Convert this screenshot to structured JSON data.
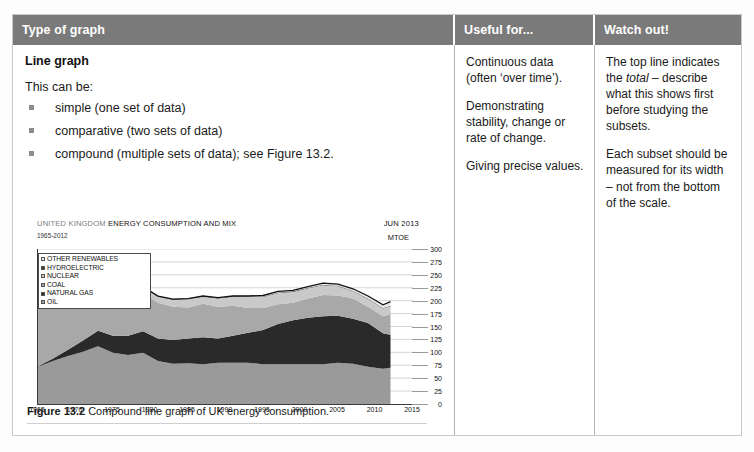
{
  "table": {
    "headers": [
      "Type of graph",
      "Useful for...",
      "Watch out!"
    ],
    "col1": {
      "title": "Line graph",
      "lead": "This can be:",
      "bullets": [
        "simple (one set of data)",
        "comparative (two sets of data)",
        "compound (multiple sets of data); see Figure 13.2."
      ],
      "caption_label": "Figure 13.2",
      "caption_text": " Compound line graph of UK energy consumption."
    },
    "col2": {
      "paragraphs": [
        "Continuous data (often ‘over time’).",
        "Demonstrating stability, change or rate of change.",
        "Giving precise values."
      ]
    },
    "col3": {
      "p1_a": "The top line indicates the ",
      "p1_em": "total",
      "p1_b": " – describe what this shows first before studying the subsets.",
      "p2": "Each subset should be measured for its width – not from the bottom of the scale."
    }
  },
  "chart_data": {
    "type": "area",
    "title_light": "UNITED KINGDOM ",
    "title_bold": "ENERGY CONSUMPTION AND MIX",
    "subtitle": "1965-2012",
    "date_label": "JUN 2013",
    "unit_label": "MTOE",
    "xlabel": "",
    "ylabel": "MTOE",
    "ylim": [
      0,
      300
    ],
    "yticks": [
      300,
      275,
      250,
      225,
      200,
      175,
      150,
      125,
      100,
      75,
      50,
      25,
      0
    ],
    "xlim": [
      1965,
      2015
    ],
    "xticks": [
      1965,
      1970,
      1975,
      1980,
      1985,
      1990,
      1995,
      2000,
      2005,
      2010,
      2015
    ],
    "grid": true,
    "legend_position": "top-left",
    "legend": [
      {
        "label": "OTHER RENEWABLES",
        "color": "#e8e8e8"
      },
      {
        "label": "HYDROELECTRIC",
        "color": "#3a3a3a"
      },
      {
        "label": "NUCLEAR",
        "color": "#c9c9c9"
      },
      {
        "label": "COAL",
        "color": "#a8a8a8"
      },
      {
        "label": "NATURAL GAS",
        "color": "#2a2a2a"
      },
      {
        "label": "OIL",
        "color": "#9a9a9a"
      }
    ],
    "x": [
      1965,
      1967,
      1969,
      1971,
      1973,
      1975,
      1977,
      1979,
      1981,
      1983,
      1985,
      1987,
      1989,
      1991,
      1993,
      1995,
      1997,
      1999,
      2001,
      2003,
      2005,
      2007,
      2009,
      2011,
      2012
    ],
    "series": [
      {
        "name": "OIL",
        "color": "#9a9a9a",
        "values": [
          72,
          83,
          93,
          101,
          112,
          99,
          95,
          99,
          83,
          78,
          79,
          77,
          80,
          80,
          80,
          77,
          77,
          77,
          77,
          77,
          80,
          78,
          72,
          68,
          70
        ]
      },
      {
        "name": "NATURAL GAS",
        "color": "#2a2a2a",
        "values": [
          1,
          5,
          12,
          22,
          30,
          33,
          37,
          42,
          44,
          46,
          48,
          52,
          47,
          52,
          58,
          66,
          78,
          85,
          90,
          93,
          91,
          87,
          85,
          69,
          64
        ]
      },
      {
        "name": "COAL",
        "color": "#a8a8a8",
        "values": [
          118,
          109,
          101,
          82,
          78,
          75,
          72,
          74,
          69,
          64,
          60,
          65,
          61,
          58,
          48,
          43,
          38,
          34,
          37,
          41,
          39,
          39,
          31,
          33,
          40
        ]
      },
      {
        "name": "NUCLEAR",
        "color": "#c9c9c9",
        "values": [
          3,
          5,
          7,
          8,
          9,
          10,
          11,
          11,
          12,
          14,
          16,
          14,
          16,
          18,
          21,
          21,
          22,
          21,
          20,
          19,
          18,
          14,
          15,
          15,
          15
        ]
      },
      {
        "name": "HYDROELECTRIC",
        "color": "#3a3a3a",
        "values": [
          1,
          1,
          1,
          1,
          1,
          1,
          1,
          1,
          1,
          1,
          1,
          1,
          1,
          1,
          1,
          1,
          1,
          1,
          1,
          1,
          1,
          1,
          1,
          1,
          1
        ]
      },
      {
        "name": "OTHER RENEWABLES",
        "color": "#e8e8e8",
        "values": [
          0,
          0,
          0,
          0,
          0,
          0,
          0,
          0,
          0,
          0,
          0,
          1,
          1,
          1,
          1,
          2,
          2,
          2,
          2,
          3,
          3,
          4,
          5,
          6,
          8
        ]
      }
    ],
    "total_line": {
      "name": "Total",
      "color": "#111111",
      "values": [
        195,
        203,
        214,
        214,
        230,
        218,
        216,
        227,
        209,
        203,
        204,
        209,
        206,
        209,
        209,
        210,
        218,
        220,
        227,
        234,
        232,
        223,
        209,
        192,
        198
      ]
    }
  }
}
